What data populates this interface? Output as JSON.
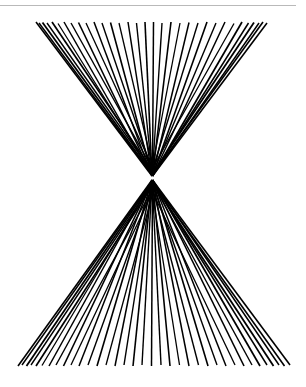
{
  "page": {
    "width": 306,
    "height": 387,
    "background_color": "#ffffff"
  },
  "top_rule": {
    "name": "horizontal-rule",
    "color": "#b9b9b9",
    "x": 0,
    "y": 5,
    "width": 296,
    "thickness": 1
  },
  "figure": {
    "name": "bowtie-ray-figure",
    "stroke_color": "#000000",
    "vertex": {
      "x": 152,
      "y": 178
    },
    "upper_fan": {
      "label": "upper-fan",
      "direction": "up",
      "ray_count": 27,
      "outer_span_x": [
        36,
        267
      ],
      "outer_span_y": 22
    },
    "lower_fan": {
      "label": "lower-fan",
      "direction": "down",
      "ray_count": 27,
      "outer_span_x": [
        18,
        290
      ],
      "outer_span_y": 366
    },
    "rays": [
      {
        "x1": 152.0,
        "y1": 176.0,
        "x2": 36.0,
        "y2": 22.0,
        "w": 1.6,
        "fan": "upper"
      },
      {
        "x1": 152.0,
        "y1": 175.0,
        "x2": 39.0,
        "y2": 23.0,
        "w": 1.5,
        "fan": "upper"
      },
      {
        "x1": 152.0,
        "y1": 174.0,
        "x2": 42.5,
        "y2": 22.5,
        "w": 1.8,
        "fan": "upper"
      },
      {
        "x1": 152.0,
        "y1": 172.0,
        "x2": 47.0,
        "y2": 23.0,
        "w": 1.4,
        "fan": "upper"
      },
      {
        "x1": 152.0,
        "y1": 170.0,
        "x2": 52.0,
        "y2": 22.0,
        "w": 1.7,
        "fan": "upper"
      },
      {
        "x1": 152.0,
        "y1": 174.0,
        "x2": 58.0,
        "y2": 23.5,
        "w": 1.3,
        "fan": "upper"
      },
      {
        "x1": 152.0,
        "y1": 176.0,
        "x2": 64.0,
        "y2": 22.0,
        "w": 1.5,
        "fan": "upper"
      },
      {
        "x1": 152.0,
        "y1": 168.0,
        "x2": 71.0,
        "y2": 23.0,
        "w": 1.4,
        "fan": "upper"
      },
      {
        "x1": 152.0,
        "y1": 175.0,
        "x2": 78.5,
        "y2": 22.5,
        "w": 1.6,
        "fan": "upper"
      },
      {
        "x1": 152.0,
        "y1": 166.0,
        "x2": 86.0,
        "y2": 23.0,
        "w": 1.3,
        "fan": "upper"
      },
      {
        "x1": 152.0,
        "y1": 176.0,
        "x2": 94.0,
        "y2": 22.0,
        "w": 1.5,
        "fan": "upper"
      },
      {
        "x1": 152.0,
        "y1": 170.0,
        "x2": 102.0,
        "y2": 23.0,
        "w": 1.4,
        "fan": "upper"
      },
      {
        "x1": 152.0,
        "y1": 176.0,
        "x2": 110.5,
        "y2": 22.5,
        "w": 1.6,
        "fan": "upper"
      },
      {
        "x1": 152.0,
        "y1": 164.0,
        "x2": 119.0,
        "y2": 23.0,
        "w": 1.3,
        "fan": "upper"
      },
      {
        "x1": 152.0,
        "y1": 176.0,
        "x2": 128.0,
        "y2": 22.0,
        "w": 1.5,
        "fan": "upper"
      },
      {
        "x1": 152.0,
        "y1": 172.0,
        "x2": 136.5,
        "y2": 23.0,
        "w": 1.4,
        "fan": "upper"
      },
      {
        "x1": 152.0,
        "y1": 176.0,
        "x2": 145.0,
        "y2": 22.0,
        "w": 1.6,
        "fan": "upper"
      },
      {
        "x1": 152.5,
        "y1": 176.0,
        "x2": 153.5,
        "y2": 22.0,
        "w": 1.5,
        "fan": "upper"
      },
      {
        "x1": 152.5,
        "y1": 172.0,
        "x2": 162.0,
        "y2": 23.0,
        "w": 1.4,
        "fan": "upper"
      },
      {
        "x1": 152.5,
        "y1": 176.0,
        "x2": 171.0,
        "y2": 22.0,
        "w": 1.6,
        "fan": "upper"
      },
      {
        "x1": 152.5,
        "y1": 166.0,
        "x2": 180.0,
        "y2": 23.0,
        "w": 1.3,
        "fan": "upper"
      },
      {
        "x1": 152.5,
        "y1": 176.0,
        "x2": 189.0,
        "y2": 22.5,
        "w": 1.5,
        "fan": "upper"
      },
      {
        "x1": 152.5,
        "y1": 170.0,
        "x2": 198.0,
        "y2": 23.0,
        "w": 1.4,
        "fan": "upper"
      },
      {
        "x1": 152.5,
        "y1": 176.0,
        "x2": 207.0,
        "y2": 22.0,
        "w": 1.6,
        "fan": "upper"
      },
      {
        "x1": 152.5,
        "y1": 174.0,
        "x2": 216.0,
        "y2": 23.0,
        "w": 1.4,
        "fan": "upper"
      },
      {
        "x1": 152.5,
        "y1": 176.0,
        "x2": 225.0,
        "y2": 22.0,
        "w": 1.5,
        "fan": "upper"
      },
      {
        "x1": 152.5,
        "y1": 168.0,
        "x2": 234.0,
        "y2": 23.5,
        "w": 1.3,
        "fan": "upper"
      },
      {
        "x1": 152.5,
        "y1": 176.0,
        "x2": 242.0,
        "y2": 22.0,
        "w": 1.7,
        "fan": "upper"
      },
      {
        "x1": 152.5,
        "y1": 175.0,
        "x2": 248.5,
        "y2": 23.0,
        "w": 1.5,
        "fan": "upper"
      },
      {
        "x1": 152.5,
        "y1": 174.0,
        "x2": 254.0,
        "y2": 22.5,
        "w": 1.8,
        "fan": "upper"
      },
      {
        "x1": 152.5,
        "y1": 176.0,
        "x2": 259.0,
        "y2": 23.0,
        "w": 1.5,
        "fan": "upper"
      },
      {
        "x1": 152.5,
        "y1": 175.0,
        "x2": 263.0,
        "y2": 22.0,
        "w": 1.6,
        "fan": "upper"
      },
      {
        "x1": 152.5,
        "y1": 176.0,
        "x2": 267.0,
        "y2": 23.0,
        "w": 1.6,
        "fan": "upper"
      },
      {
        "x1": 152.0,
        "y1": 180.0,
        "x2": 18.0,
        "y2": 366.0,
        "w": 1.6,
        "fan": "lower"
      },
      {
        "x1": 152.0,
        "y1": 181.0,
        "x2": 22.0,
        "y2": 365.0,
        "w": 1.5,
        "fan": "lower"
      },
      {
        "x1": 152.0,
        "y1": 182.0,
        "x2": 26.5,
        "y2": 366.0,
        "w": 1.8,
        "fan": "lower"
      },
      {
        "x1": 152.0,
        "y1": 184.0,
        "x2": 31.0,
        "y2": 365.0,
        "w": 1.4,
        "fan": "lower"
      },
      {
        "x1": 152.0,
        "y1": 186.0,
        "x2": 36.0,
        "y2": 366.0,
        "w": 1.7,
        "fan": "lower"
      },
      {
        "x1": 152.0,
        "y1": 182.0,
        "x2": 42.0,
        "y2": 365.5,
        "w": 1.3,
        "fan": "lower"
      },
      {
        "x1": 152.0,
        "y1": 180.0,
        "x2": 49.0,
        "y2": 366.0,
        "w": 1.5,
        "fan": "lower"
      },
      {
        "x1": 152.0,
        "y1": 190.0,
        "x2": 56.0,
        "y2": 365.0,
        "w": 1.4,
        "fan": "lower"
      },
      {
        "x1": 152.0,
        "y1": 181.0,
        "x2": 63.5,
        "y2": 366.0,
        "w": 1.6,
        "fan": "lower"
      },
      {
        "x1": 152.0,
        "y1": 193.0,
        "x2": 71.0,
        "y2": 365.0,
        "w": 1.3,
        "fan": "lower"
      },
      {
        "x1": 152.0,
        "y1": 180.0,
        "x2": 79.0,
        "y2": 366.0,
        "w": 1.5,
        "fan": "lower"
      },
      {
        "x1": 152.0,
        "y1": 188.0,
        "x2": 88.0,
        "y2": 365.0,
        "w": 1.4,
        "fan": "lower"
      },
      {
        "x1": 152.0,
        "y1": 180.0,
        "x2": 97.0,
        "y2": 366.0,
        "w": 1.6,
        "fan": "lower"
      },
      {
        "x1": 152.0,
        "y1": 196.0,
        "x2": 106.0,
        "y2": 365.0,
        "w": 1.3,
        "fan": "lower"
      },
      {
        "x1": 152.0,
        "y1": 180.0,
        "x2": 115.0,
        "y2": 366.0,
        "w": 1.5,
        "fan": "lower"
      },
      {
        "x1": 152.0,
        "y1": 186.0,
        "x2": 124.0,
        "y2": 365.0,
        "w": 1.4,
        "fan": "lower"
      },
      {
        "x1": 152.0,
        "y1": 180.0,
        "x2": 133.0,
        "y2": 366.0,
        "w": 1.6,
        "fan": "lower"
      },
      {
        "x1": 152.0,
        "y1": 182.0,
        "x2": 142.0,
        "y2": 365.0,
        "w": 1.4,
        "fan": "lower"
      },
      {
        "x1": 152.5,
        "y1": 180.0,
        "x2": 151.5,
        "y2": 366.0,
        "w": 1.5,
        "fan": "lower"
      },
      {
        "x1": 152.5,
        "y1": 186.0,
        "x2": 161.0,
        "y2": 365.0,
        "w": 1.4,
        "fan": "lower"
      },
      {
        "x1": 152.5,
        "y1": 180.0,
        "x2": 170.0,
        "y2": 366.0,
        "w": 1.6,
        "fan": "lower"
      },
      {
        "x1": 152.5,
        "y1": 194.0,
        "x2": 179.5,
        "y2": 365.0,
        "w": 1.3,
        "fan": "lower"
      },
      {
        "x1": 152.5,
        "y1": 180.0,
        "x2": 189.0,
        "y2": 366.0,
        "w": 1.5,
        "fan": "lower"
      },
      {
        "x1": 152.5,
        "y1": 188.0,
        "x2": 198.5,
        "y2": 365.0,
        "w": 1.4,
        "fan": "lower"
      },
      {
        "x1": 152.5,
        "y1": 180.0,
        "x2": 208.0,
        "y2": 366.0,
        "w": 1.6,
        "fan": "lower"
      },
      {
        "x1": 152.5,
        "y1": 184.0,
        "x2": 217.0,
        "y2": 365.0,
        "w": 1.4,
        "fan": "lower"
      },
      {
        "x1": 152.5,
        "y1": 180.0,
        "x2": 226.0,
        "y2": 366.0,
        "w": 1.5,
        "fan": "lower"
      },
      {
        "x1": 152.5,
        "y1": 192.0,
        "x2": 235.0,
        "y2": 365.0,
        "w": 1.3,
        "fan": "lower"
      },
      {
        "x1": 152.5,
        "y1": 180.0,
        "x2": 244.0,
        "y2": 366.0,
        "w": 1.6,
        "fan": "lower"
      },
      {
        "x1": 152.5,
        "y1": 183.0,
        "x2": 252.0,
        "y2": 365.0,
        "w": 1.4,
        "fan": "lower"
      },
      {
        "x1": 152.5,
        "y1": 180.0,
        "x2": 260.0,
        "y2": 366.0,
        "w": 1.7,
        "fan": "lower"
      },
      {
        "x1": 152.5,
        "y1": 181.0,
        "x2": 267.0,
        "y2": 365.0,
        "w": 1.5,
        "fan": "lower"
      },
      {
        "x1": 152.5,
        "y1": 182.0,
        "x2": 273.5,
        "y2": 366.0,
        "w": 1.8,
        "fan": "lower"
      },
      {
        "x1": 152.5,
        "y1": 180.0,
        "x2": 279.0,
        "y2": 365.0,
        "w": 1.5,
        "fan": "lower"
      },
      {
        "x1": 152.5,
        "y1": 181.0,
        "x2": 284.5,
        "y2": 366.0,
        "w": 1.6,
        "fan": "lower"
      },
      {
        "x1": 152.5,
        "y1": 180.0,
        "x2": 290.0,
        "y2": 365.0,
        "w": 1.6,
        "fan": "lower"
      }
    ]
  }
}
